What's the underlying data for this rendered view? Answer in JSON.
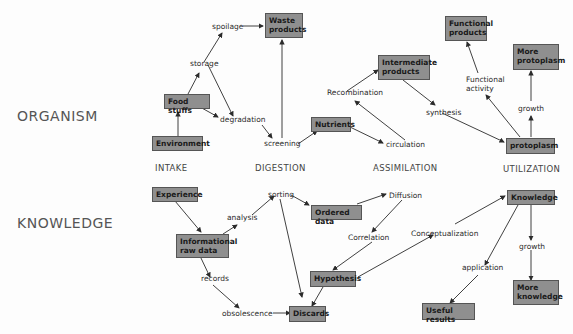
{
  "rows": {
    "organism": "ORGANISM",
    "knowledge": "KNOWLEDGE"
  },
  "columns": [
    "INTAKE",
    "DIGESTION",
    "ASSIMILATION",
    "UTILIZATION"
  ],
  "organism": {
    "boxes": {
      "environment": "Environment",
      "food_stuffs": "Food stuffs",
      "waste_products": "Waste products",
      "nutrients": "Nutrients",
      "intermediate_products": "Intermediate products",
      "functional_products": "Functional products",
      "more_protoplasm": "More protoplasm",
      "protoplasm": "protoplasm"
    },
    "labels": {
      "spoilage": "spoilage",
      "storage": "storage",
      "degradation": "degradation",
      "screening": "screening",
      "recombination": "Recombination",
      "circulation": "circulation",
      "synthesis": "synthesis",
      "functional_activity_1": "Functional",
      "functional_activity_2": "activity",
      "growth": "growth"
    }
  },
  "knowledge": {
    "boxes": {
      "experience": "Experience",
      "informational_raw_data": "Informational raw data",
      "ordered_data": "Ordered data",
      "hypothesis": "Hypothesis",
      "discards": "Discards",
      "knowledge": "Knowledge",
      "useful_results": "Useful results",
      "more_knowledge": "More knowledge"
    },
    "labels": {
      "analysis": "analysis",
      "sorting": "sorting",
      "records": "records",
      "obsolescence": "obsolescence",
      "diffusion": "Diffusion",
      "correlation": "Correlation",
      "conceptualization": "Conceptualization",
      "application": "application",
      "growth": "growth"
    }
  }
}
